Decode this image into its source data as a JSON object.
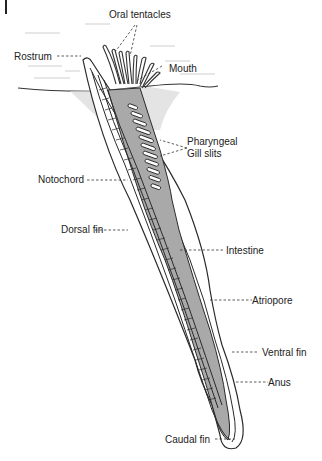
{
  "diagram": {
    "labels": {
      "oral_tentacles": "Oral tentacles",
      "rostrum": "Rostrum",
      "mouth": "Mouth",
      "pharyngeal_gill_slits_line1": "Pharyngeal",
      "pharyngeal_gill_slits_line2": "Gill slits",
      "notochord": "Notochord",
      "dorsal_fin": "Dorsal fin",
      "intestine": "Intestine",
      "atriopore": "Atriopore",
      "ventral_fin": "Ventral fin",
      "anus": "Anus",
      "caudal_fin": "Caudal fin"
    },
    "colors": {
      "outline": "#2a2a2a",
      "gut_fill": "#a9a9a9",
      "sediment": "#d6d6d6",
      "water_lines": "#c8c8c8",
      "label_text": "#222222"
    }
  }
}
